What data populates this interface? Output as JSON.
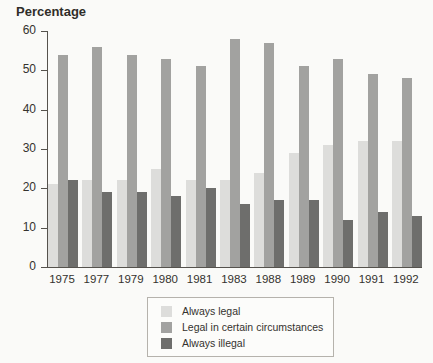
{
  "figure": {
    "background": "#fafaf8",
    "text_color": "#34322e",
    "axis_color": "#55524d"
  },
  "chart_data": {
    "type": "bar",
    "title": "",
    "ylabel": "Percentage",
    "xlabel": "",
    "ylim": [
      0,
      60
    ],
    "yticks": [
      0,
      10,
      20,
      30,
      40,
      50,
      60
    ],
    "grid": false,
    "legend_position": "bottom-center",
    "categories": [
      "1975",
      "1977",
      "1979",
      "1980",
      "1981",
      "1983",
      "1988",
      "1989",
      "1990",
      "1991",
      "1992"
    ],
    "series": [
      {
        "name": "Always legal",
        "color": "#dddddb",
        "values": [
          21,
          22,
          22,
          25,
          22,
          22,
          24,
          29,
          31,
          32,
          32
        ]
      },
      {
        "name": "Legal in certain circumstances",
        "color": "#a2a2a0",
        "values": [
          54,
          56,
          54,
          53,
          51,
          58,
          57,
          51,
          53,
          49,
          48
        ]
      },
      {
        "name": "Always illegal",
        "color": "#6e6e6c",
        "values": [
          22,
          19,
          19,
          18,
          20,
          16,
          17,
          17,
          12,
          14,
          13
        ]
      }
    ]
  }
}
